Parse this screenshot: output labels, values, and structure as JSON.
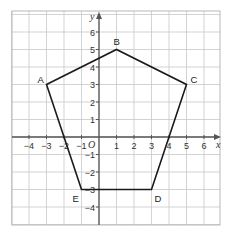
{
  "diagram": {
    "type": "coordinate-grid-pentagon",
    "axes": {
      "x_label": "x",
      "y_label": "y",
      "origin_label": "O",
      "x_ticks": [
        "-4",
        "-3",
        "-2",
        "-1",
        "1",
        "2",
        "3",
        "4",
        "5",
        "6"
      ],
      "y_ticks": [
        "6",
        "5",
        "4",
        "3",
        "2",
        "1",
        "-1",
        "-2",
        "-3",
        "-4"
      ],
      "x_range": [
        -5,
        7
      ],
      "y_range": [
        -5,
        7
      ]
    },
    "vertices": [
      {
        "label": "A",
        "x": -3,
        "y": 3
      },
      {
        "label": "B",
        "x": 1,
        "y": 5
      },
      {
        "label": "C",
        "x": 5,
        "y": 3
      },
      {
        "label": "D",
        "x": 3,
        "y": -3
      },
      {
        "label": "E",
        "x": -1,
        "y": -3
      }
    ],
    "colors": {
      "grid": "#c8c8c8",
      "axis": "#555555",
      "shape": "#1a1a1a",
      "background": "#ffffff"
    }
  }
}
